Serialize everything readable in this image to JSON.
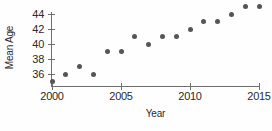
{
  "chart_data": {
    "type": "scatter",
    "title": "",
    "xlabel": "Year",
    "ylabel": "Mean Age",
    "x": [
      2000,
      2001,
      2002,
      2003,
      2004,
      2005,
      2006,
      2007,
      2008,
      2009,
      2010,
      2011,
      2012,
      2013,
      2014,
      2015
    ],
    "values": [
      35,
      36,
      37,
      36,
      39,
      39,
      41,
      40,
      41,
      41,
      42,
      43,
      43,
      44,
      45,
      45
    ],
    "xlim": [
      2000,
      2015
    ],
    "ylim": [
      35,
      45
    ],
    "xticks": [
      2000,
      2005,
      2010,
      2015
    ],
    "xtick_labels": [
      "2000",
      "2005",
      "2010",
      "2015"
    ],
    "yticks": [
      36,
      38,
      40,
      42,
      44
    ],
    "ytick_labels": [
      "36",
      "38",
      "40",
      "42",
      "44"
    ],
    "grid": false,
    "legend": false,
    "marker_color": "#555555",
    "axis_color": "#6e6e6e",
    "background_color": "#fefefe"
  }
}
